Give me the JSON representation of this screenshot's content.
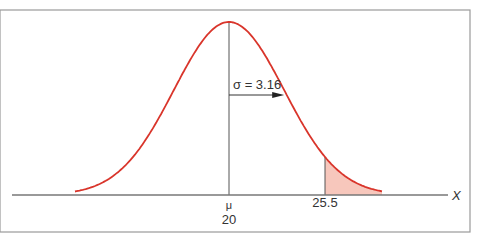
{
  "chart_data": {
    "type": "area",
    "title": "",
    "xlabel": "X",
    "ylabel": "",
    "mean": 20,
    "mean_label": "μ",
    "sd": 3.16,
    "sd_label": "σ = 3.16",
    "shaded_from": 25.5,
    "shaded_label": "25.5",
    "tick_labels": [
      "20",
      "25.5"
    ],
    "curve_color": "#d9352b",
    "shade_color": "#f7c7bc",
    "axis_color": "#777777",
    "grid": false,
    "legend": null
  }
}
